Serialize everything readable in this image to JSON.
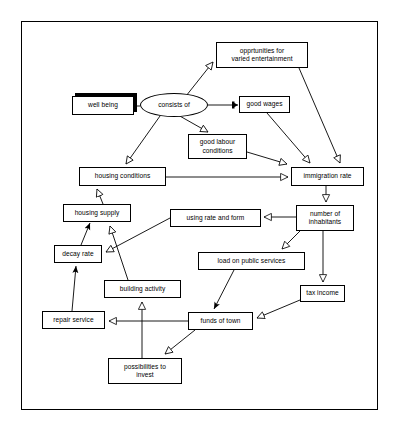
{
  "diagram": {
    "frame": {
      "border_color": "#000000",
      "background": "#ffffff"
    },
    "nodes": [
      {
        "id": "well_being",
        "label": "well being",
        "shape": "box-shadow",
        "x": 72,
        "y": 96,
        "w": 62,
        "h": 19
      },
      {
        "id": "consists_of",
        "label": "consists of",
        "shape": "ellipse",
        "x": 140,
        "y": 93,
        "w": 68,
        "h": 24
      },
      {
        "id": "opportunities",
        "label": "opprtunities for\nvaried entertainment",
        "shape": "box",
        "x": 216,
        "y": 42,
        "w": 92,
        "h": 26
      },
      {
        "id": "good_wages",
        "label": "good wages",
        "shape": "box",
        "x": 239,
        "y": 96,
        "w": 51,
        "h": 17
      },
      {
        "id": "good_labour",
        "label": "good labour\nconditions",
        "shape": "box",
        "x": 188,
        "y": 134,
        "w": 59,
        "h": 25
      },
      {
        "id": "housing_conditions",
        "label": "housing conditions",
        "shape": "box",
        "x": 79,
        "y": 167,
        "w": 87,
        "h": 19
      },
      {
        "id": "immigration_rate",
        "label": "immigration rate",
        "shape": "box",
        "x": 291,
        "y": 167,
        "w": 73,
        "h": 19
      },
      {
        "id": "housing_supply",
        "label": "housing supply",
        "shape": "box",
        "x": 63,
        "y": 204,
        "w": 68,
        "h": 18
      },
      {
        "id": "using_rate_form",
        "label": "using rate and form",
        "shape": "box",
        "x": 170,
        "y": 209,
        "w": 91,
        "h": 18
      },
      {
        "id": "number_inhabitants",
        "label": "number of\ninhabitants",
        "shape": "box",
        "x": 296,
        "y": 205,
        "w": 58,
        "h": 26
      },
      {
        "id": "decay_rate",
        "label": "decay rate",
        "shape": "box",
        "x": 54,
        "y": 245,
        "w": 48,
        "h": 18
      },
      {
        "id": "load_public",
        "label": "load on public services",
        "shape": "box",
        "x": 198,
        "y": 252,
        "w": 107,
        "h": 18
      },
      {
        "id": "building_activity",
        "label": "building activity",
        "shape": "box",
        "x": 104,
        "y": 280,
        "w": 77,
        "h": 18
      },
      {
        "id": "tax_income",
        "label": "tax income",
        "shape": "box",
        "x": 300,
        "y": 285,
        "w": 45,
        "h": 17
      },
      {
        "id": "repair_service",
        "label": "repair service",
        "shape": "box",
        "x": 42,
        "y": 311,
        "w": 63,
        "h": 18
      },
      {
        "id": "funds_of_town",
        "label": "funds of town",
        "shape": "box",
        "x": 188,
        "y": 312,
        "w": 65,
        "h": 18
      },
      {
        "id": "possibilities",
        "label": "possibilities to\ninvest",
        "shape": "box",
        "x": 108,
        "y": 358,
        "w": 74,
        "h": 26
      }
    ],
    "edges": [
      {
        "from": "well_being",
        "to": "consists_of",
        "arrow": "none"
      },
      {
        "from": "consists_of",
        "to": "opportunities",
        "arrow": "hollow"
      },
      {
        "from": "consists_of",
        "to": "good_wages",
        "arrow": "solid-bar"
      },
      {
        "from": "consists_of",
        "to": "good_labour",
        "arrow": "hollow"
      },
      {
        "from": "consists_of",
        "to": "housing_conditions",
        "arrow": "hollow"
      },
      {
        "from": "opportunities",
        "to": "immigration_rate",
        "arrow": "hollow"
      },
      {
        "from": "good_wages",
        "to": "immigration_rate",
        "arrow": "hollow"
      },
      {
        "from": "good_labour",
        "to": "immigration_rate",
        "arrow": "hollow"
      },
      {
        "from": "housing_conditions",
        "to": "immigration_rate",
        "arrow": "hollow"
      },
      {
        "from": "housing_supply",
        "to": "housing_conditions",
        "arrow": "hollow"
      },
      {
        "from": "immigration_rate",
        "to": "number_inhabitants",
        "arrow": "hollow"
      },
      {
        "from": "number_inhabitants",
        "to": "using_rate_form",
        "arrow": "hollow"
      },
      {
        "from": "number_inhabitants",
        "to": "load_public",
        "arrow": "hollow"
      },
      {
        "from": "number_inhabitants",
        "to": "tax_income",
        "arrow": "hollow"
      },
      {
        "from": "using_rate_form",
        "to": "decay_rate",
        "arrow": "hollow"
      },
      {
        "from": "decay_rate",
        "to": "housing_supply",
        "arrow": "line"
      },
      {
        "from": "building_activity",
        "to": "housing_supply",
        "arrow": "hollow"
      },
      {
        "from": "repair_service",
        "to": "decay_rate",
        "arrow": "line"
      },
      {
        "from": "load_public",
        "to": "funds_of_town",
        "arrow": "line"
      },
      {
        "from": "tax_income",
        "to": "funds_of_town",
        "arrow": "hollow"
      },
      {
        "from": "funds_of_town",
        "to": "repair_service",
        "arrow": "hollow"
      },
      {
        "from": "funds_of_town",
        "to": "possibilities",
        "arrow": "hollow"
      },
      {
        "from": "possibilities",
        "to": "building_activity",
        "arrow": "hollow"
      }
    ]
  }
}
